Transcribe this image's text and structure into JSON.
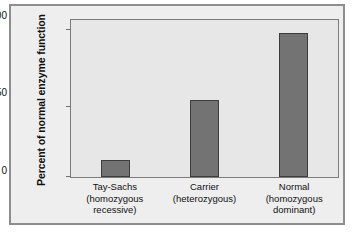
{
  "figure": {
    "background_color": "#eeeeee",
    "plot_background_color": "#e7e7e7",
    "bar_color": "#737373",
    "bar_outline_color": "#3d3d3d",
    "axis_color": "#7b7b7b"
  },
  "chart_data": {
    "type": "bar",
    "title": "",
    "xlabel": "",
    "ylabel": "Percent of normal enzyme function",
    "ylim": [
      0,
      110
    ],
    "yticks": [
      0,
      50,
      100
    ],
    "ytick_labels": [
      "0",
      "50",
      "100"
    ],
    "grid": false,
    "legend": false,
    "categories": [
      "Tay-Sachs (homozygous recessive)",
      "Carrier (heterozygous)",
      "Normal (homozygous dominant)"
    ],
    "category_lines": [
      [
        "Tay-Sachs",
        "(homozygous",
        "recessive)"
      ],
      [
        "Carrier",
        "(heterozygous)",
        ""
      ],
      [
        "Normal",
        "(homozygous",
        "dominant)"
      ]
    ],
    "values": [
      12,
      55,
      103
    ],
    "value_units": "percent"
  }
}
